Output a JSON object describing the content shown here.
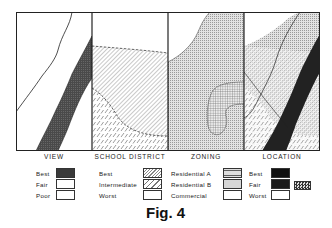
{
  "figure": {
    "caption": "Fig. 4",
    "panels": [
      {
        "id": "view",
        "title": "VIEW"
      },
      {
        "id": "school",
        "title": "SCHOOL DISTRICT"
      },
      {
        "id": "zoning",
        "title": "ZONING"
      },
      {
        "id": "location",
        "title": "LOCATION"
      }
    ]
  },
  "legends": {
    "view": {
      "items": [
        {
          "label": "Best",
          "swatch": "dark-stipple"
        },
        {
          "label": "Fair",
          "swatch": "white"
        },
        {
          "label": "Poor",
          "swatch": "white"
        }
      ]
    },
    "school": {
      "items": [
        {
          "label": "Best",
          "swatch": "fine-diagonal-hatch"
        },
        {
          "label": "Intermediate",
          "swatch": "dashed-diagonal-hatch"
        },
        {
          "label": "Worst",
          "swatch": "white"
        }
      ]
    },
    "zoning": {
      "items": [
        {
          "label": "Residential  A",
          "swatch": "crosshatch-grid"
        },
        {
          "label": "Residential  B",
          "swatch": "light-stipple"
        },
        {
          "label": "Commercial",
          "swatch": "white"
        }
      ]
    },
    "location": {
      "items": [
        {
          "label": "Best",
          "swatch": "black"
        },
        {
          "label": "Fair",
          "swatch": "black"
        },
        {
          "label": "Worst",
          "swatch": "white"
        }
      ],
      "extra_swatch": "checkered"
    }
  },
  "colors": {
    "ink": "#1a1a1a",
    "dark_band": "#3a3a3a",
    "stipple": "#cfcfcf",
    "paper": "#ffffff"
  }
}
